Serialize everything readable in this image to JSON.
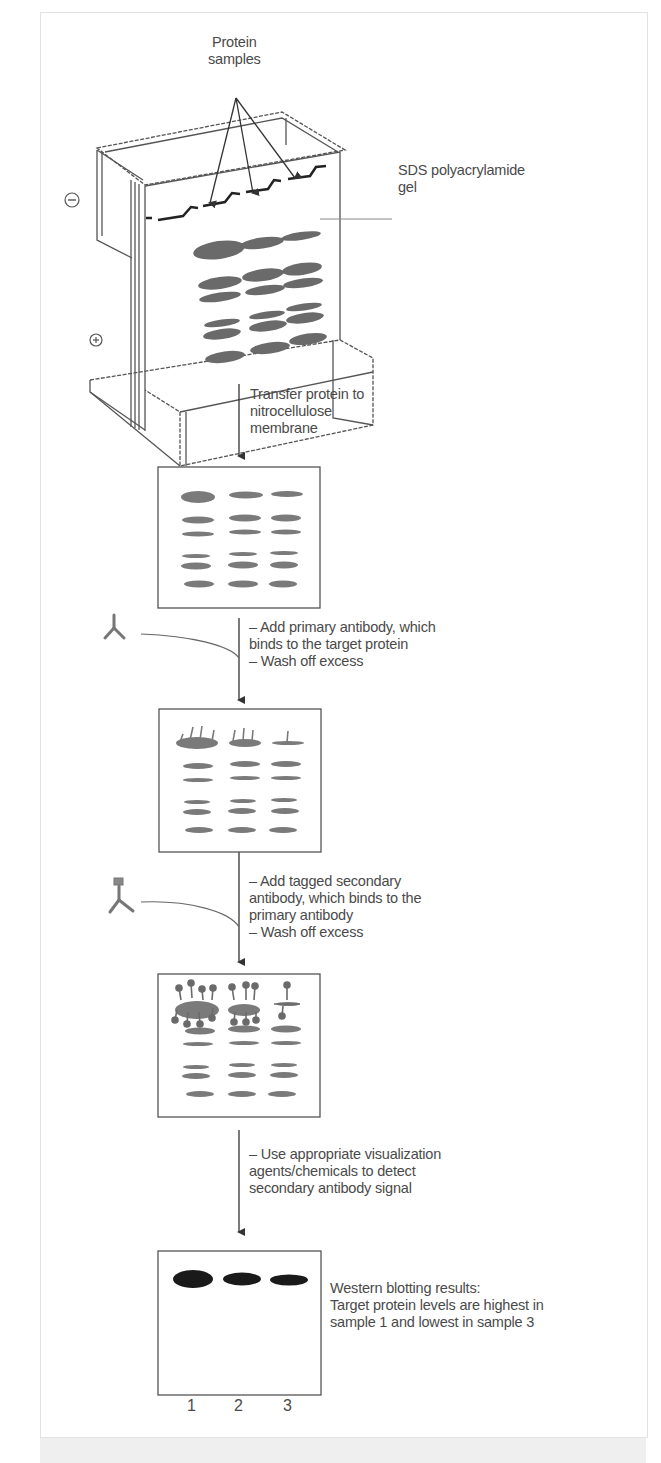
{
  "labels": {
    "protein_samples": [
      "Protein",
      "samples"
    ],
    "gel": [
      "SDS polyacrylamide",
      "gel"
    ],
    "electrode_negative": "−",
    "electrode_positive": "+"
  },
  "steps": [
    {
      "id": "transfer",
      "lines": [
        "Transfer protein to",
        "nitrocellulose",
        "membrane"
      ]
    },
    {
      "id": "primary",
      "lines": [
        "– Add primary antibody, which",
        "binds to the target protein",
        "– Wash off excess"
      ],
      "reagent_icon": "primary-antibody-icon"
    },
    {
      "id": "secondary",
      "lines": [
        "– Add tagged secondary",
        "antibody, which binds to the",
        "primary antibody",
        "– Wash off excess"
      ],
      "reagent_icon": "tagged-secondary-antibody-icon"
    },
    {
      "id": "visualize",
      "lines": [
        "– Use appropriate visualization",
        "agents/chemicals to detect",
        "secondary antibody signal"
      ]
    }
  ],
  "result": {
    "lines": [
      "Western blotting results:",
      "Target protein levels are highest in",
      "sample 1 and lowest in sample 3"
    ],
    "lanes": [
      "1",
      "2",
      "3"
    ]
  },
  "colors": {
    "line": "#4a4a4a",
    "band": "#6e6e6e",
    "result_band": "#1a1a1a",
    "frame": "#e2e2e2"
  }
}
